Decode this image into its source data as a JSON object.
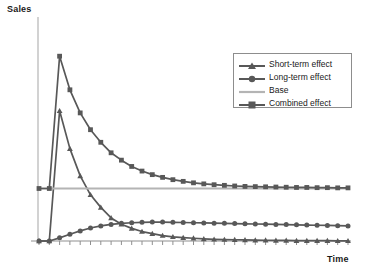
{
  "chart_data": {
    "type": "line",
    "title": "",
    "xlabel": "Time",
    "ylabel": "Sales",
    "grid": false,
    "legend_position": "upper-right",
    "xlim": [
      0,
      30
    ],
    "ylim": [
      0,
      100
    ],
    "x": [
      0,
      1,
      2,
      3,
      4,
      5,
      6,
      7,
      8,
      9,
      10,
      11,
      12,
      13,
      14,
      15,
      16,
      17,
      18,
      19,
      20,
      21,
      22,
      23,
      24,
      25,
      26,
      27,
      28,
      29,
      30
    ],
    "series": [
      {
        "name": "Short-term effect",
        "marker": "triangle",
        "color": "#585858",
        "values": [
          0,
          0,
          62,
          44,
          31,
          22,
          16,
          11,
          8,
          6,
          4.5,
          3.5,
          2.6,
          2,
          1.6,
          1.3,
          1,
          0.8,
          0.7,
          0.6,
          0.5,
          0.4,
          0.35,
          0.3,
          0.25,
          0.2,
          0.2,
          0.15,
          0.15,
          0.1,
          0.1
        ]
      },
      {
        "name": "Long-term effect",
        "marker": "circle",
        "color": "#585858",
        "values": [
          0,
          0,
          1.5,
          3.2,
          4.8,
          6.2,
          7.2,
          7.9,
          8.4,
          8.7,
          8.9,
          9.0,
          9.0,
          8.9,
          8.8,
          8.7,
          8.6,
          8.5,
          8.4,
          8.3,
          8.2,
          8.1,
          8.0,
          7.9,
          7.8,
          7.7,
          7.6,
          7.5,
          7.4,
          7.3,
          7.2
        ]
      },
      {
        "name": "Base",
        "marker": "none",
        "color": "#b4b4b4",
        "values": [
          25,
          25,
          25,
          25,
          25,
          25,
          25,
          25,
          25,
          25,
          25,
          25,
          25,
          25,
          25,
          25,
          25,
          25,
          25,
          25,
          25,
          25,
          25,
          25,
          25,
          25,
          25,
          25,
          25,
          25,
          25
        ]
      },
      {
        "name": "Combined effect",
        "marker": "square",
        "color": "#585858",
        "values": [
          25,
          25,
          88,
          72,
          61,
          53,
          47,
          42,
          38.5,
          35.5,
          33.3,
          31.6,
          30.3,
          29.2,
          28.4,
          27.7,
          27.2,
          26.8,
          26.5,
          26.2,
          26.0,
          25.9,
          25.8,
          25.7,
          25.6,
          25.5,
          25.5,
          25.4,
          25.4,
          25.3,
          25.3
        ]
      }
    ]
  },
  "legend": {
    "items": [
      {
        "label": "Short-term effect",
        "marker": "triangle-marker",
        "color": "#585858"
      },
      {
        "label": "Long-term effect",
        "marker": "circle-marker",
        "color": "#585858"
      },
      {
        "label": "Base",
        "marker": "line-marker",
        "color": "#b4b4b4"
      },
      {
        "label": "Combined effect",
        "marker": "square-marker",
        "color": "#585858"
      }
    ]
  },
  "axes": {
    "y_title": "Sales",
    "x_title": "Time",
    "axis_color": "#b9b9b9",
    "tick_count": 30
  }
}
